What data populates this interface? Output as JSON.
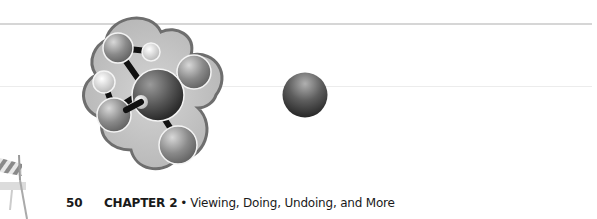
{
  "page": {
    "number": "50",
    "chapter_label": "CHAPTER 2",
    "separator": "•",
    "chapter_title": "Viewing, Doing, Undoing, and More"
  },
  "illustrations": {
    "molecule": "molecule-illustration",
    "sphere": "sphere-illustration",
    "barricade": "construction-barricade-illustration"
  }
}
